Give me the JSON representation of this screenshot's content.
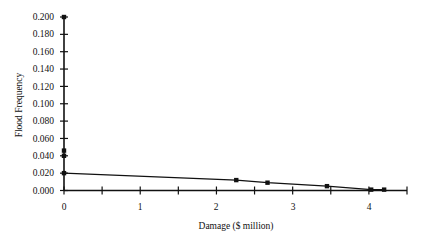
{
  "chart_data": {
    "type": "line",
    "title": "",
    "xlabel": "Damage ($ million)",
    "ylabel": "Flood Frequency",
    "xlim": [
      0,
      4.5
    ],
    "ylim": [
      0,
      0.2
    ],
    "x_ticks": [
      0,
      0.5,
      1,
      1.5,
      2,
      2.5,
      3,
      3.5,
      4,
      4.5
    ],
    "x_tick_labels": [
      "0",
      "",
      "1",
      "",
      "2",
      "",
      "3",
      "",
      "4",
      ""
    ],
    "y_ticks": [
      0,
      0.02,
      0.04,
      0.06,
      0.08,
      0.1,
      0.12,
      0.14,
      0.16,
      0.18,
      0.2
    ],
    "y_tick_labels": [
      "0.000",
      "0.020",
      "0.040",
      "0.060",
      "0.080",
      "0.100",
      "0.120",
      "0.140",
      "0.160",
      "0.180",
      "0.200"
    ],
    "grid": false,
    "legend": null,
    "series": [
      {
        "name": "Damage-frequency curve",
        "x": [
          0,
          2.26,
          2.67,
          3.45,
          4.03,
          4.2
        ],
        "y": [
          0.02,
          0.012,
          0.009,
          0.005,
          0.001,
          0.001
        ],
        "marker": "square",
        "line": true
      },
      {
        "name": "Points at zero damage",
        "x": [
          0,
          0,
          0
        ],
        "y": [
          0.2,
          0.046,
          0.04
        ],
        "marker": "square",
        "line": false
      }
    ]
  },
  "labels": {
    "xlabel": "Damage ($ million)",
    "ylabel": "Flood Frequency",
    "yticks": [
      "0.200",
      "0.180",
      "0.160",
      "0.140",
      "0.120",
      "0.100",
      "0.080",
      "0.060",
      "0.040",
      "0.020",
      "0.000"
    ],
    "xticks": [
      "0",
      "1",
      "2",
      "3",
      "4"
    ]
  }
}
